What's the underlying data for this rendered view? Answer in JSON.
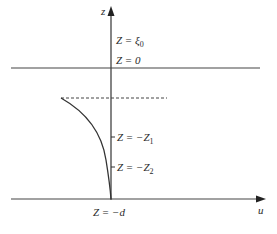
{
  "diagram": {
    "axes": {
      "vertical_label": "z",
      "horizontal_label": "u"
    },
    "labels": {
      "surface_elevation": {
        "prefix": "Z = ",
        "symbol": "ξ",
        "subscript": "0"
      },
      "mean_level": "Z = 0",
      "depth_1": {
        "prefix": "Z = −",
        "symbol": "Z",
        "subscript": "1"
      },
      "depth_2": {
        "prefix": "Z = −",
        "symbol": "Z",
        "subscript": "2"
      },
      "bottom": "Z = −d"
    },
    "colors": {
      "line": "#333333",
      "background": "#ffffff"
    }
  }
}
